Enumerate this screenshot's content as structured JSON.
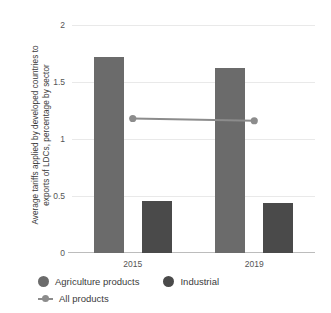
{
  "chart_data": {
    "type": "bar",
    "title": "",
    "subtitle": "",
    "xlabel": "",
    "ylabel": "Average tariffs applied by developed countries to exports of LDCs, percentage by sector",
    "ylabel_lines": [
      "Average tariffs applied by developed countries to",
      "exports of LDCs, percentage by sector"
    ],
    "categories": [
      "2015",
      "2019"
    ],
    "ylim": [
      0,
      2
    ],
    "yticks": [
      "0",
      "0.5",
      "1",
      "1.5",
      "2"
    ],
    "ytick_values": [
      0,
      0.5,
      1,
      1.5,
      2
    ],
    "grid": true,
    "legend_position": "bottom-left",
    "series": [
      {
        "name": "Agriculture products",
        "type": "bar",
        "color": "#6b6b6b",
        "values": [
          1.72,
          1.62
        ]
      },
      {
        "name": "Industrial",
        "type": "bar",
        "color": "#4a4a4a",
        "values": [
          0.46,
          0.44
        ]
      },
      {
        "name": "All products",
        "type": "line",
        "color": "#8c8c8c",
        "values": [
          1.18,
          1.16
        ]
      }
    ]
  },
  "axis": {
    "y_ticks": [
      {
        "label": "2",
        "value": 2
      },
      {
        "label": "1.5",
        "value": 1.5
      },
      {
        "label": "1",
        "value": 1
      },
      {
        "label": "0.5",
        "value": 0.5
      },
      {
        "label": "0",
        "value": 0
      }
    ],
    "x_ticks": [
      {
        "label": "2015"
      },
      {
        "label": "2019"
      }
    ]
  },
  "legend": {
    "items": [
      {
        "label": "Agriculture products",
        "marker": "dot",
        "color": "#6b6b6b"
      },
      {
        "label": "Industrial",
        "marker": "dot",
        "color": "#4a4a4a"
      },
      {
        "label": "All products",
        "marker": "line",
        "color": "#8c8c8c"
      }
    ]
  },
  "colors": {
    "agriculture": "#6b6b6b",
    "industrial": "#4a4a4a",
    "all_products": "#8c8c8c",
    "gridline": "#e9e9e9",
    "axis": "#bcbcbc",
    "text": "#3b3b3b",
    "background": "#ffffff"
  }
}
